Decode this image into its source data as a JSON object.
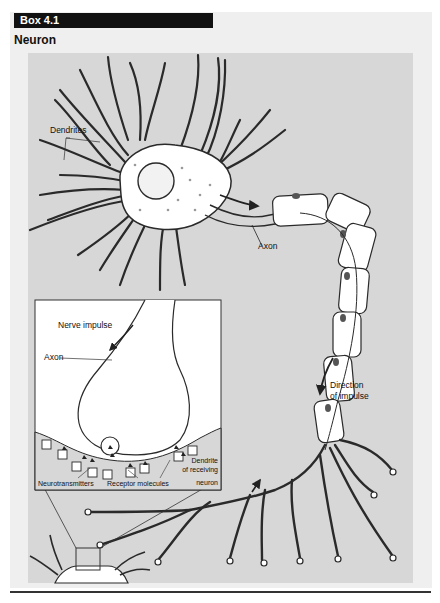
{
  "box": {
    "label": "Box 4.1",
    "title": "Neuron",
    "colors": {
      "label_bg": "#111111",
      "label_fg": "#ffffff",
      "outer_bg": "#efefef",
      "panel_bg": "#d7d7d7",
      "cell_fill": "#ffffff",
      "outline": "#333333"
    }
  },
  "diagram": {
    "labels": {
      "dendrites": "Dendrites",
      "axon": "Axon",
      "direction_line1": "Direction",
      "direction_line2": "of impulse"
    },
    "inset": {
      "nerve_impulse": "Nerve impulse",
      "axon": "Axon",
      "neurotransmitters": "Neurotransmitters",
      "receptor_molecules": "Receptor molecules",
      "dendrite_line1": "Dendrite",
      "dendrite_line2": "of receiving",
      "dendrite_line3": "neuron"
    }
  }
}
